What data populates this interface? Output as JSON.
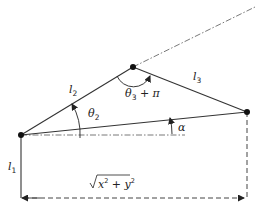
{
  "diagram": {
    "type": "planar-three-link-manipulator",
    "labels": {
      "l1": {
        "base": "l",
        "sub": "1"
      },
      "l2": {
        "base": "l",
        "sub": "2"
      },
      "l3": {
        "base": "l",
        "sub": "3"
      },
      "theta2": {
        "base": "θ",
        "sub": "2"
      },
      "theta3_pi": {
        "base": "θ",
        "sub": "3",
        "suffix": " + π"
      },
      "alpha": "α",
      "distance": {
        "prefix": "√",
        "x": "x",
        "x_exp": "2",
        "plus": " + ",
        "y": "y",
        "y_exp": "2"
      }
    },
    "nodes": {
      "base": [
        21,
        135
      ],
      "elbow": [
        133,
        67
      ],
      "end": [
        247,
        112
      ]
    },
    "colors": {
      "line": "#333333",
      "node": "#111111",
      "dashed": "#444444",
      "dashdot": "#555555"
    }
  }
}
